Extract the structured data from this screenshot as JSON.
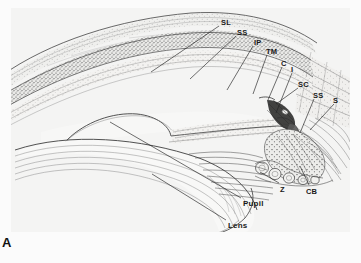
{
  "figure": {
    "panel_letter": "A",
    "description_title": "Anterior segment of the eye — iridocorneal angle",
    "background_color": "#f2f2f1",
    "ink_color": "#3a3a3a",
    "label_color": "#1a1a1a"
  },
  "labels": [
    {
      "id": "SL",
      "text": "SL",
      "x": 221,
      "y": 19,
      "leader": {
        "x1": 219,
        "y1": 26,
        "x2": 151,
        "y2": 72
      }
    },
    {
      "id": "SS1",
      "text": "SS",
      "x": 237,
      "y": 29,
      "leader": {
        "x1": 236,
        "y1": 36,
        "x2": 190,
        "y2": 79
      }
    },
    {
      "id": "IP",
      "text": "IP",
      "x": 254,
      "y": 39,
      "leader": {
        "x1": 253,
        "y1": 46,
        "x2": 227,
        "y2": 90
      }
    },
    {
      "id": "TM",
      "text": "TM",
      "x": 266,
      "y": 48,
      "leader": {
        "x1": 267,
        "y1": 55,
        "x2": 253,
        "y2": 94
      }
    },
    {
      "id": "C",
      "text": "C",
      "x": 281,
      "y": 60,
      "leader": {
        "x1": 282,
        "y1": 67,
        "x2": 268,
        "y2": 100
      }
    },
    {
      "id": "I",
      "text": "I",
      "x": 291,
      "y": 66,
      "leader": {
        "x1": 292,
        "y1": 73,
        "x2": 276,
        "y2": 113
      }
    },
    {
      "id": "SC",
      "text": "SC",
      "x": 298,
      "y": 81,
      "leader": {
        "x1": 298,
        "y1": 88,
        "x2": 276,
        "y2": 104
      }
    },
    {
      "id": "SS2",
      "text": "SS",
      "x": 313,
      "y": 92,
      "leader": {
        "x1": 314,
        "y1": 99,
        "x2": 300,
        "y2": 133
      }
    },
    {
      "id": "S",
      "text": "S",
      "x": 333,
      "y": 97,
      "leader": {
        "x1": 334,
        "y1": 104,
        "x2": 310,
        "y2": 130
      }
    },
    {
      "id": "Z",
      "text": "Z",
      "x": 280,
      "y": 186,
      "leader": {
        "x1": 279,
        "y1": 183,
        "x2": 260,
        "y2": 172
      }
    },
    {
      "id": "CB",
      "text": "CB",
      "x": 306,
      "y": 188,
      "leader": {
        "x1": 309,
        "y1": 185,
        "x2": 300,
        "y2": 166
      }
    },
    {
      "id": "Pupil",
      "text": "Pupil",
      "x": 243,
      "y": 200,
      "leader": {
        "x1": 241,
        "y1": 198,
        "x2": 110,
        "y2": 122
      }
    },
    {
      "id": "Lens",
      "text": "Lens",
      "x": 228,
      "y": 222,
      "leader": {
        "x1": 226,
        "y1": 220,
        "x2": 152,
        "y2": 174
      }
    }
  ],
  "abbreviations": {
    "SL": "Schwalbe line",
    "SS": "scleral spur",
    "IP": "iris process",
    "TM": "trabecular meshwork",
    "C": "cornea",
    "I": "iris",
    "SC": "Schlemm canal",
    "S": "sclera",
    "Z": "zonules",
    "CB": "ciliary body",
    "Pupil": "pupil",
    "Lens": "lens"
  }
}
